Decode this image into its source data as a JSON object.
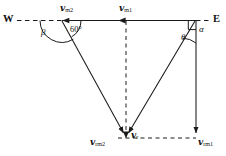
{
  "figure": {
    "type": "vector-diagram",
    "colors": {
      "stroke": "#1a1a1a",
      "background": "#ffffff"
    },
    "compass": {
      "west_label": "W",
      "east_label": "E"
    },
    "vectors": [
      {
        "id": "v-m2",
        "label_main": "v",
        "label_sub": "m2",
        "x": 60,
        "y": 5,
        "direction": "east-west-axis-left-segment"
      },
      {
        "id": "v-m1",
        "label_main": "v",
        "label_sub": "m1",
        "x": 120,
        "y": 5,
        "direction": "west-pointing"
      },
      {
        "id": "v-rm2",
        "label_main": "v",
        "label_sub": "rm2",
        "x": 93,
        "y": 139,
        "direction": "down-right-from-left-vertex"
      },
      {
        "id": "v-r",
        "label_main": "v",
        "label_sub": "r",
        "x": 131,
        "y": 133,
        "direction": "resultant-downward"
      },
      {
        "id": "v-rm1",
        "label_main": "v",
        "label_sub": "rm1",
        "x": 199,
        "y": 141,
        "direction": "downward-from-right-vertex"
      }
    ],
    "angles": [
      {
        "id": "beta",
        "symbol": "β",
        "x": 42,
        "y": 29,
        "at_vertex": "left"
      },
      {
        "id": "sixty",
        "symbol": "60°",
        "x": 72,
        "y": 27,
        "at_vertex": "left"
      },
      {
        "id": "alpha",
        "symbol": "α",
        "x": 199,
        "y": 27,
        "at_vertex": "right"
      },
      {
        "id": "theta",
        "symbol": "θ",
        "x": 182,
        "y": 36,
        "at_vertex": "right"
      }
    ],
    "markers": {
      "right_angle_vertex": "right-top-corner"
    }
  }
}
